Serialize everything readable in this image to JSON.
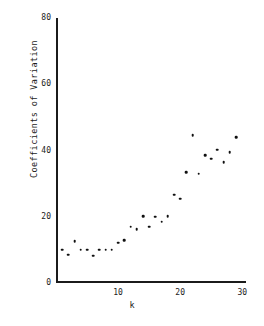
{
  "chart_data": {
    "type": "scatter",
    "title": "",
    "xlabel": "k",
    "ylabel": "Coefficients of Variation",
    "xlim": [
      0,
      30.6
    ],
    "ylim": [
      0,
      80
    ],
    "xticks": [
      10,
      20,
      30
    ],
    "yticks": [
      0,
      20,
      40,
      60,
      80
    ],
    "xtick_labels": [
      "10",
      "20",
      "30"
    ],
    "ytick_labels": [
      "0",
      "20",
      "40",
      "60",
      "80"
    ],
    "grid": false,
    "legend": null,
    "marker": "filled-circle",
    "marker_color": "#101010",
    "axis_color": "#1b1b1b",
    "background_color": "#ffffff",
    "x": [
      1,
      2,
      3,
      4,
      5,
      6,
      7,
      8,
      9,
      10,
      11,
      12,
      13,
      14,
      15,
      16,
      17,
      18,
      19,
      20,
      21,
      22,
      23,
      24,
      25,
      26,
      27,
      28,
      29
    ],
    "y": [
      10.0,
      8.6,
      12.7,
      10.0,
      10.0,
      8.2,
      10.0,
      10.0,
      10.0,
      12.2,
      13.0,
      17.0,
      16.2,
      20.2,
      17.0,
      20.0,
      18.5,
      20.2,
      26.7,
      25.5,
      33.4,
      44.6,
      33.0,
      38.6,
      37.5,
      40.2,
      36.5,
      39.4,
      44.0
    ],
    "points": [
      {
        "k": 1,
        "cv": 10.0
      },
      {
        "k": 2,
        "cv": 8.6
      },
      {
        "k": 3,
        "cv": 12.7
      },
      {
        "k": 4,
        "cv": 10.0
      },
      {
        "k": 5,
        "cv": 10.0
      },
      {
        "k": 6,
        "cv": 8.2
      },
      {
        "k": 7,
        "cv": 10.0
      },
      {
        "k": 8,
        "cv": 10.0
      },
      {
        "k": 9,
        "cv": 10.0
      },
      {
        "k": 10,
        "cv": 12.2
      },
      {
        "k": 11,
        "cv": 13.0
      },
      {
        "k": 12,
        "cv": 17.0
      },
      {
        "k": 13,
        "cv": 16.2
      },
      {
        "k": 14,
        "cv": 20.2
      },
      {
        "k": 15,
        "cv": 17.0
      },
      {
        "k": 16,
        "cv": 20.0
      },
      {
        "k": 17,
        "cv": 18.5
      },
      {
        "k": 18,
        "cv": 20.2
      },
      {
        "k": 19,
        "cv": 26.7
      },
      {
        "k": 20,
        "cv": 25.5
      },
      {
        "k": 21,
        "cv": 33.4
      },
      {
        "k": 22,
        "cv": 44.6
      },
      {
        "k": 23,
        "cv": 33.0
      },
      {
        "k": 24,
        "cv": 38.6
      },
      {
        "k": 25,
        "cv": 37.5
      },
      {
        "k": 26,
        "cv": 40.2
      },
      {
        "k": 27,
        "cv": 36.5
      },
      {
        "k": 28,
        "cv": 39.4
      },
      {
        "k": 29,
        "cv": 44.0
      }
    ]
  }
}
